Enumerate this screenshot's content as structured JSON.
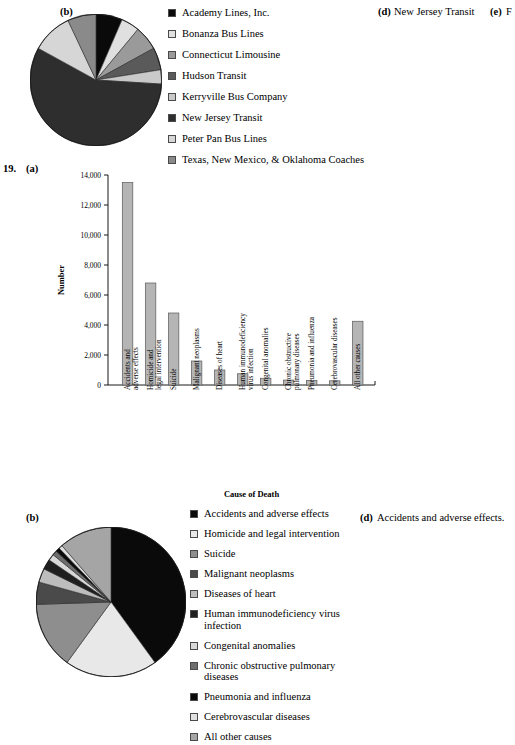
{
  "page": {
    "question_number": "19.",
    "width": 515,
    "height": 717
  },
  "top_section": {
    "part_label": "(b)",
    "part_d_label": "(d)",
    "part_d_text": "New Jersey Transit",
    "part_e_label": "(e)",
    "part_e_text": "F"
  },
  "bottom_section": {
    "part_label": "(b)",
    "part_d_label": "(d)",
    "part_d_text": "Accidents and adverse effects."
  },
  "middle_section": {
    "part_label": "(a)"
  },
  "colors": {
    "black": "#0a0a0a",
    "near_white": "#e8e8e8",
    "light_gray": "#c9c9c9",
    "mid_gray": "#9a9a9a",
    "dark_gray": "#6e6e6e",
    "darker_gray": "#3f3f3f",
    "very_light": "#dedede",
    "bar_fill": "#b5b5b5",
    "bar_stroke": "#5a5a5a",
    "axis": "#000000"
  },
  "chart_data": [
    {
      "id": "bus-carriers-pie",
      "type": "pie",
      "title": "",
      "legend_position": "right",
      "categories": [
        "Academy Lines, Inc.",
        "Bonanza Bus Lines",
        "Connecticut Limousine",
        "Hudson Transit",
        "Kerryville Bus Company",
        "New Jersey Transit",
        "Peter Pan Bus Lines",
        "Texas, New Mexico, & Oklahoma Coaches"
      ],
      "values": [
        6.5,
        4.5,
        6.0,
        5.5,
        3.5,
        57.0,
        10.0,
        7.0
      ],
      "slice_colors": [
        "#0a0a0a",
        "#e0e0e0",
        "#9a9a9a",
        "#5a5a5a",
        "#c9c9c9",
        "#2e2e2e",
        "#d6d6d6",
        "#8a8a8a"
      ]
    },
    {
      "id": "cause-of-death-bar",
      "type": "bar",
      "title": "",
      "xlabel": "Cause of Death",
      "ylabel": "Number",
      "ylim": [
        0,
        14000
      ],
      "yticks": [
        0,
        2000,
        4000,
        6000,
        8000,
        10000,
        12000,
        14000
      ],
      "ytick_labels": [
        "0",
        "2,000",
        "4,000",
        "6,000",
        "8,000",
        "10,000",
        "12,000",
        "14,000"
      ],
      "grid": false,
      "categories": [
        "Accidents and\nadverse effects",
        "Homicide and\nlegal intervention",
        "Suicide",
        "Malignant neoplasms",
        "Diseases of heart",
        "Human immunodeficiency\nvirus infection",
        "Congenital anomalies",
        "Chronic obstructive\npulmonary diseases",
        "Pneumonia and influenza",
        "Cerebrovascular diseases",
        "All other causes"
      ],
      "values": [
        13500,
        6800,
        4800,
        1600,
        1000,
        750,
        450,
        330,
        300,
        280,
        4250
      ]
    },
    {
      "id": "cause-of-death-pie",
      "type": "pie",
      "title": "",
      "legend_position": "right",
      "categories": [
        "Accidents and adverse effects",
        "Homicide and legal intervention",
        "Suicide",
        "Malignant neoplasms",
        "Diseases of heart",
        "Human immunodeficiency virus\ninfection",
        "Congenital anomalies",
        "Chronic obstructive pulmonary\ndiseases",
        "Pneumonia and influenza",
        "Cerebrovascular diseases",
        "All other causes"
      ],
      "values": [
        40.0,
        20.0,
        14.5,
        4.8,
        3.0,
        2.2,
        1.4,
        1.0,
        0.9,
        0.8,
        11.4
      ],
      "slice_colors": [
        "#0a0a0a",
        "#e8e8e8",
        "#8e8e8e",
        "#4a4a4a",
        "#bdbdbd",
        "#1f1f1f",
        "#d8d8d8",
        "#6e6e6e",
        "#0a0a0a",
        "#e0e0e0",
        "#a5a5a5"
      ]
    }
  ]
}
